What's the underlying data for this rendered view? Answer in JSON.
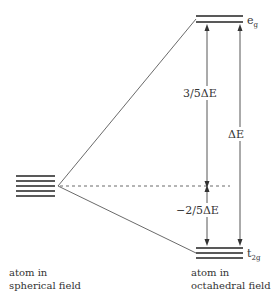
{
  "diagram": {
    "left_state": {
      "caption_line1": "atom in",
      "caption_line2": "spherical field",
      "degenerate_levels": 5
    },
    "right_state": {
      "caption_line1": "atom in",
      "caption_line2": "octahedral field",
      "upper_set": {
        "label_main": "e",
        "label_sub": "g",
        "levels": 2
      },
      "lower_set": {
        "label_main": "t",
        "label_sub": "2g",
        "levels": 3
      }
    },
    "energy_labels": {
      "upper_shift": "3/5ΔE",
      "lower_shift": "−2/5ΔE",
      "total_split": "ΔE"
    },
    "barycenter_line": "dashed"
  }
}
